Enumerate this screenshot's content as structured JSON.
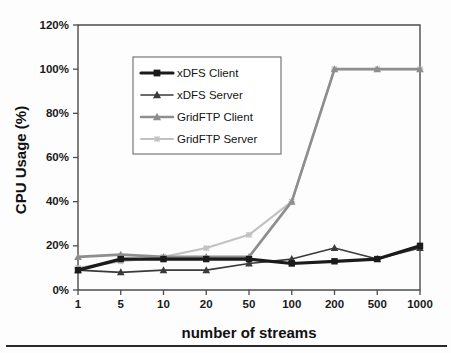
{
  "chart_data": {
    "type": "line",
    "title": "",
    "xlabel": "number of streams",
    "ylabel": "CPU Usage (%)",
    "categories": [
      "1",
      "5",
      "10",
      "20",
      "50",
      "100",
      "200",
      "500",
      "1000"
    ],
    "ylim": [
      0,
      120
    ],
    "ytick_labels": [
      "0%",
      "20%",
      "40%",
      "60%",
      "80%",
      "100%",
      "120%"
    ],
    "ytick_values": [
      0,
      20,
      40,
      60,
      80,
      100,
      120
    ],
    "grid": false,
    "legend_position": "upper-left-inside",
    "series": [
      {
        "name": "xDFS Client",
        "color": "#1b1b1b",
        "marker": "square",
        "values": [
          9,
          14,
          14,
          14,
          14,
          12,
          13,
          14,
          20
        ]
      },
      {
        "name": "xDFS Server",
        "color": "#3a3a3a",
        "marker": "triangle",
        "values": [
          9,
          8,
          9,
          9,
          12,
          14,
          19,
          14,
          19
        ]
      },
      {
        "name": "GridFTP Client",
        "color": "#8e8e8e",
        "marker": "triangle",
        "values": [
          15,
          16,
          15,
          15,
          15,
          40,
          100,
          100,
          100
        ]
      },
      {
        "name": "GridFTP Server",
        "color": "#c2c2c2",
        "marker": "cross",
        "values": [
          10,
          13,
          15,
          19,
          25,
          40,
          100,
          100,
          100
        ]
      }
    ]
  },
  "axis": {
    "x_title": "number of streams",
    "y_title": "CPU Usage (%)"
  },
  "legend": {
    "items": [
      {
        "label": "xDFS Client"
      },
      {
        "label": "xDFS Server"
      },
      {
        "label": "GridFTP Client"
      },
      {
        "label": "GridFTP Server"
      }
    ]
  },
  "colors": {
    "xdfs_client": "#1b1b1b",
    "xdfs_server": "#3a3a3a",
    "gridftp_client": "#8e8e8e",
    "gridftp_server": "#c2c2c2",
    "axis": "#4c4c4c",
    "background": "#fdfdfd"
  }
}
